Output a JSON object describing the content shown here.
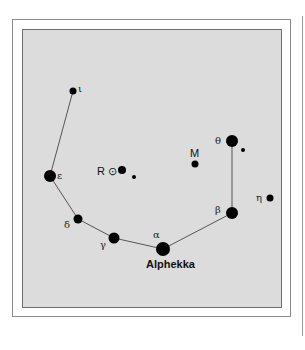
{
  "diagram": {
    "colors": {
      "panel": "#dcdcdc",
      "star": "#000000",
      "line": "#555555",
      "frame": "#8a8a8a"
    },
    "stars": [
      {
        "id": "iota",
        "label": "ι",
        "x": 73,
        "y": 91,
        "r": 3.5
      },
      {
        "id": "epsilon",
        "label": "ε",
        "x": 50,
        "y": 176,
        "r": 6
      },
      {
        "id": "delta",
        "label": "δ",
        "x": 78,
        "y": 219,
        "r": 4.5
      },
      {
        "id": "gamma",
        "label": "γ",
        "x": 114,
        "y": 238,
        "r": 5.5
      },
      {
        "id": "alpha",
        "label": "α",
        "name": "Alphekka",
        "x": 163,
        "y": 249,
        "r": 7
      },
      {
        "id": "beta",
        "label": "β",
        "x": 232,
        "y": 213,
        "r": 6
      },
      {
        "id": "theta",
        "label": "θ",
        "x": 232,
        "y": 141,
        "r": 6
      },
      {
        "id": "eta",
        "label": "η",
        "x": 270,
        "y": 198,
        "r": 3.5
      },
      {
        "id": "theta-companion",
        "label": "",
        "x": 243,
        "y": 150,
        "r": 2
      },
      {
        "id": "M",
        "label": "M",
        "x": 195,
        "y": 164,
        "r": 3.5
      },
      {
        "id": "R",
        "label": "R ⊙",
        "x": 122,
        "y": 170,
        "r": 4
      },
      {
        "id": "R-companion",
        "label": "",
        "x": 134,
        "y": 177,
        "r": 2
      }
    ],
    "labels": {
      "iota": "ι",
      "epsilon": "ε",
      "delta": "δ",
      "gamma": "γ",
      "alpha": "α",
      "alpha_name": "Alphekka",
      "beta": "β",
      "theta": "θ",
      "eta": "η",
      "M": "M",
      "R": "R ⊙"
    },
    "lines": [
      [
        "iota",
        "epsilon"
      ],
      [
        "epsilon",
        "delta"
      ],
      [
        "delta",
        "gamma"
      ],
      [
        "gamma",
        "alpha"
      ],
      [
        "alpha",
        "beta"
      ],
      [
        "beta",
        "theta"
      ]
    ]
  }
}
